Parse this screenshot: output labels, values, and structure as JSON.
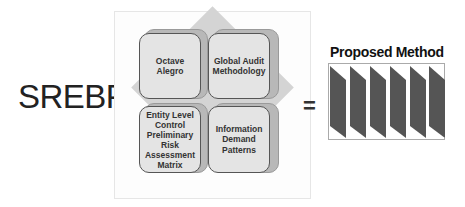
{
  "left_label": "SREBP +",
  "equals": "=",
  "quadrants": [
    {
      "label": "Octave Alegro"
    },
    {
      "label": "Global Audit Methodology"
    },
    {
      "label": "Entity Level Control Preliminary Risk Assessment Matrix"
    },
    {
      "label": "Information Demand Patterns"
    }
  ],
  "result": {
    "title": "Proposed Method",
    "step_count": 6,
    "step_color": "#555555"
  },
  "colors": {
    "tile_fill": "#e4e4e4",
    "tile_shadow": "#b8b8b8",
    "diamond": "#d4d4d4"
  }
}
